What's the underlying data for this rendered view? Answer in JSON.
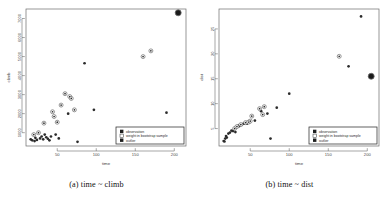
{
  "figure": {
    "panels": [
      {
        "caption": "(a) time ~ climb",
        "legend": {
          "items": [
            {
              "label": "observation",
              "marker": "filled-square",
              "color": "#1f1f1f"
            },
            {
              "label": "weight in bootstrap sample",
              "marker": "open-square",
              "color": "#ffffff"
            },
            {
              "label": "outlier",
              "marker": "filled-square",
              "color": "#1f1f1f"
            }
          ]
        },
        "chart_data": {
          "type": "scatter",
          "title": "",
          "xlabel": "time",
          "ylabel": "climb",
          "xlim": [
            10,
            215
          ],
          "ylim": [
            300,
            7500
          ],
          "xticks": [
            50,
            100,
            150,
            200
          ],
          "yticks": [
            1000,
            2000,
            3000,
            4000,
            5000,
            6000,
            7000
          ],
          "grid": false,
          "legend_position": "bottom-right",
          "series": [
            {
              "name": "observation",
              "marker": "filled-circle",
              "points": [
                [
                  16,
                  650
                ],
                [
                  18,
                  600
                ],
                [
                  20,
                  900
                ],
                [
                  21,
                  560
                ],
                [
                  22,
                  730
                ],
                [
                  24,
                  620
                ],
                [
                  26,
                  1000
                ],
                [
                  28,
                  700
                ],
                [
                  30,
                  800
                ],
                [
                  32,
                  650
                ],
                [
                  33,
                  1500
                ],
                [
                  34,
                  900
                ],
                [
                  36,
                  760
                ],
                [
                  38,
                  680
                ],
                [
                  40,
                  600
                ],
                [
                  42,
                  800
                ],
                [
                  44,
                  2100
                ],
                [
                  46,
                  1850
                ],
                [
                  48,
                  900
                ],
                [
                  50,
                  1550
                ],
                [
                  52,
                  700
                ],
                [
                  55,
                  2450
                ],
                [
                  60,
                  3050
                ],
                [
                  64,
                  2000
                ],
                [
                  66,
                  2900
                ],
                [
                  68,
                  2800
                ],
                [
                  72,
                  2200
                ],
                [
                  76,
                  520
                ],
                [
                  85,
                  4650
                ],
                [
                  97,
                  2200
                ],
                [
                  160,
                  5000
                ],
                [
                  170,
                  5300
                ],
                [
                  190,
                  2050
                ]
              ]
            },
            {
              "name": "weight in bootstrap sample",
              "marker": "open-circle",
              "points": [
                [
                  20,
                  900
                ],
                [
                  26,
                  1000
                ],
                [
                  33,
                  1500
                ],
                [
                  44,
                  2100
                ],
                [
                  46,
                  1850
                ],
                [
                  50,
                  1550
                ],
                [
                  55,
                  2450
                ],
                [
                  60,
                  3050
                ],
                [
                  66,
                  2900
                ],
                [
                  68,
                  2800
                ],
                [
                  72,
                  2200
                ],
                [
                  160,
                  5000
                ],
                [
                  170,
                  5300
                ]
              ]
            },
            {
              "name": "outlier",
              "marker": "large-filled-circle",
              "points": [
                [
                  205,
                  7300
                ]
              ]
            }
          ]
        }
      },
      {
        "caption": "(b) time ~ dist",
        "legend": {
          "items": [
            {
              "label": "observation",
              "marker": "filled-square",
              "color": "#1f1f1f"
            },
            {
              "label": "weight in bootstrap sample",
              "marker": "open-square",
              "color": "#ffffff"
            },
            {
              "label": "outlier",
              "marker": "filled-square",
              "color": "#1f1f1f"
            }
          ]
        },
        "chart_data": {
          "type": "scatter",
          "title": "",
          "xlabel": "time",
          "ylabel": "dist",
          "xlim": [
            10,
            215
          ],
          "ylim": [
            1.5,
            29
          ],
          "xticks": [
            50,
            100,
            150,
            200
          ],
          "yticks": [
            5,
            10,
            15,
            20,
            25
          ],
          "grid": false,
          "legend_position": "bottom-right",
          "series": [
            {
              "name": "observation",
              "marker": "filled-circle",
              "points": [
                [
                  16,
                  2.5
                ],
                [
                  17,
                  2.4
                ],
                [
                  18,
                  3.0
                ],
                [
                  19,
                  3.5
                ],
                [
                  20,
                  3.2
                ],
                [
                  22,
                  4.0
                ],
                [
                  24,
                  4.2
                ],
                [
                  26,
                  4.6
                ],
                [
                  28,
                  4.5
                ],
                [
                  30,
                  5.0
                ],
                [
                  31,
                  4.3
                ],
                [
                  33,
                  5.4
                ],
                [
                  35,
                  5.6
                ],
                [
                  36,
                  5.5
                ],
                [
                  38,
                  5.8
                ],
                [
                  40,
                  5.9
                ],
                [
                  42,
                  6.0
                ],
                [
                  44,
                  6.2
                ],
                [
                  46,
                  6.0
                ],
                [
                  48,
                  6.3
                ],
                [
                  50,
                  6.5
                ],
                [
                  52,
                  7.5
                ],
                [
                  56,
                  6.6
                ],
                [
                  62,
                  9.0
                ],
                [
                  64,
                  8.5
                ],
                [
                  66,
                  7.8
                ],
                [
                  68,
                  9.4
                ],
                [
                  72,
                  8.0
                ],
                [
                  76,
                  3.0
                ],
                [
                  84,
                  9.2
                ],
                [
                  100,
                  12.0
                ],
                [
                  164,
                  19.5
                ],
                [
                  176,
                  17.5
                ],
                [
                  192,
                  27.5
                ]
              ]
            },
            {
              "name": "weight in bootstrap sample",
              "marker": "open-circle",
              "points": [
                [
                  30,
                  5.0
                ],
                [
                  33,
                  5.4
                ],
                [
                  38,
                  5.8
                ],
                [
                  44,
                  6.2
                ],
                [
                  48,
                  6.3
                ],
                [
                  50,
                  6.5
                ],
                [
                  52,
                  7.5
                ],
                [
                  62,
                  9.0
                ],
                [
                  66,
                  7.8
                ],
                [
                  68,
                  9.4
                ],
                [
                  164,
                  19.5
                ]
              ]
            },
            {
              "name": "outlier",
              "marker": "large-filled-circle",
              "points": [
                [
                  205,
                  15.5
                ]
              ]
            }
          ]
        }
      }
    ]
  }
}
